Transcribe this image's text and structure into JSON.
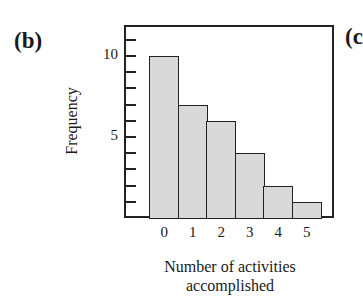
{
  "panel_label": "(b)",
  "next_panel_label": "(c",
  "chart_data": {
    "type": "bar",
    "title": "",
    "categories": [
      "0",
      "1",
      "2",
      "3",
      "4",
      "5"
    ],
    "values": [
      10,
      7,
      6,
      4,
      2,
      1
    ],
    "xlabel": "Number of activities accomplished",
    "xlabel_lines": [
      "Number of activities",
      "accomplished"
    ],
    "ylabel": "Frequency",
    "ylim": [
      0,
      11.5
    ],
    "yticks_labeled": [
      5,
      10
    ],
    "yticks_minor": [
      1,
      2,
      3,
      4,
      5,
      6,
      7,
      8,
      9,
      10,
      11
    ],
    "grid": false,
    "legend": null,
    "bar_color": "#d9d9d9",
    "edge_color": "#222222"
  }
}
